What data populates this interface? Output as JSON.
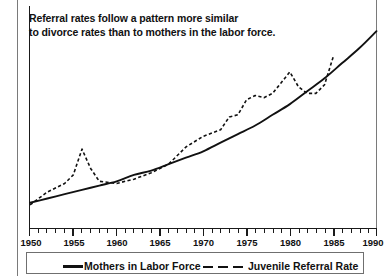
{
  "title": {
    "line1": "Referral rates follow a pattern more similar",
    "line2": "to divorce rates than to mothers in the labor force."
  },
  "axis": {
    "x_tick_labels": [
      "1950",
      "1955",
      "1960",
      "1965",
      "1970",
      "1975",
      "1980",
      "1985",
      "1990"
    ],
    "x_min": 1950,
    "x_max": 1990
  },
  "legend": {
    "entries": [
      {
        "label": "Mothers in Labor Force",
        "style": "solid"
      },
      {
        "label": "Juvenile Referral Rate",
        "style": "dashed"
      }
    ]
  },
  "colors": {
    "ink": "#111111",
    "frame": "#7a7a7a",
    "background": "#ffffff"
  },
  "chart_data": {
    "type": "line",
    "title": "Referral rates follow a pattern more similar to divorce rates than to mothers in the labor force.",
    "xlabel": "",
    "ylabel": "",
    "xlim": [
      1950,
      1990
    ],
    "ylim": [
      0,
      100
    ],
    "grid": false,
    "legend_position": "bottom",
    "x_tick_labels": [
      "1950",
      "1955",
      "1960",
      "1965",
      "1970",
      "1975",
      "1980",
      "1985",
      "1990"
    ],
    "y_axis_visible": true,
    "y_tick_labels": [],
    "series": [
      {
        "name": "Mothers in Labor Force",
        "style": "solid",
        "x": [
          1950,
          1952,
          1954,
          1956,
          1958,
          1960,
          1962,
          1964,
          1966,
          1968,
          1970,
          1972,
          1974,
          1976,
          1978,
          1980,
          1982,
          1984,
          1986,
          1988,
          1990
        ],
        "values": [
          12,
          14,
          16,
          18,
          20,
          22,
          25,
          27,
          30,
          33,
          36,
          40,
          44,
          48,
          53,
          58,
          64,
          70,
          77,
          84,
          92
        ]
      },
      {
        "name": "Juvenile Referral Rate",
        "style": "dashed",
        "x": [
          1950,
          1952,
          1954,
          1955,
          1956,
          1957,
          1958,
          1960,
          1962,
          1964,
          1966,
          1968,
          1970,
          1972,
          1973,
          1974,
          1975,
          1976,
          1977,
          1978,
          1979,
          1980,
          1981,
          1982,
          1983,
          1984,
          1985
        ],
        "values": [
          11,
          17,
          21,
          25,
          37,
          28,
          22,
          21,
          23,
          26,
          30,
          38,
          43,
          46,
          52,
          53,
          60,
          62,
          61,
          63,
          68,
          73,
          66,
          63,
          63,
          67,
          80
        ]
      }
    ]
  }
}
